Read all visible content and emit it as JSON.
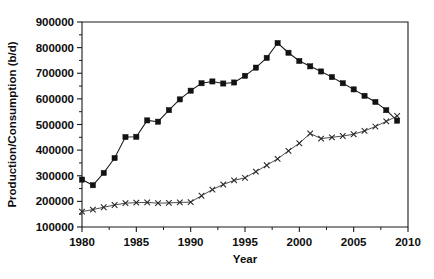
{
  "chart_data": {
    "type": "line",
    "title": "",
    "xlabel": "Year",
    "ylabel": "Production/Consumption (b/d)",
    "xlim": [
      1980,
      2010
    ],
    "ylim": [
      100000,
      900000
    ],
    "xticks": [
      1980,
      1985,
      1990,
      1995,
      2000,
      2005,
      2010
    ],
    "xtick_labels": [
      "1980",
      "1985",
      "1990",
      "1995",
      "2000",
      "2005",
      "2010"
    ],
    "yticks": [
      100000,
      200000,
      300000,
      400000,
      500000,
      600000,
      700000,
      800000,
      900000
    ],
    "ytick_labels": [
      "100000",
      "200000",
      "300000",
      "400000",
      "500000",
      "600000",
      "700000",
      "800000",
      "900000"
    ],
    "y_minor_tick_step": 50000,
    "grid": false,
    "legend": "none",
    "series": [
      {
        "name": "Production",
        "marker": "square",
        "x": [
          1980,
          1981,
          1982,
          1983,
          1984,
          1985,
          1986,
          1987,
          1988,
          1989,
          1990,
          1991,
          1992,
          1993,
          1994,
          1995,
          1996,
          1997,
          1998,
          1999,
          2000,
          2001,
          2002,
          2003,
          2004,
          2005,
          2006,
          2007,
          2008,
          2009
        ],
        "values": [
          285000,
          263000,
          311000,
          369000,
          451000,
          452000,
          516000,
          511000,
          556000,
          598000,
          632000,
          661000,
          668000,
          660000,
          664000,
          690000,
          722000,
          760000,
          818000,
          780000,
          748000,
          727000,
          707000,
          685000,
          661000,
          637000,
          612000,
          588000,
          556000,
          515000
        ]
      },
      {
        "name": "Consumption",
        "marker": "cross",
        "x": [
          1980,
          1981,
          1982,
          1983,
          1984,
          1985,
          1986,
          1987,
          1988,
          1989,
          1990,
          1991,
          1992,
          1993,
          1994,
          1995,
          1996,
          1997,
          1998,
          1999,
          2000,
          2001,
          2002,
          2003,
          2004,
          2005,
          2006,
          2007,
          2008,
          2009
        ],
        "values": [
          160000,
          168000,
          177000,
          186000,
          193000,
          195000,
          196000,
          193000,
          194000,
          196000,
          197000,
          222000,
          246000,
          266000,
          282000,
          292000,
          316000,
          341000,
          366000,
          397000,
          427000,
          465000,
          445000,
          450000,
          455000,
          462000,
          475000,
          492000,
          512000,
          533000
        ]
      }
    ]
  }
}
